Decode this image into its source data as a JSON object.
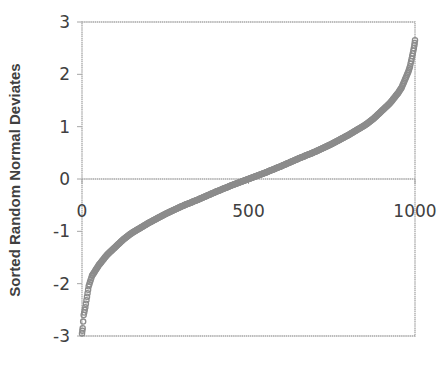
{
  "chart_data": {
    "type": "scatter",
    "title": "",
    "xlabel": "",
    "ylabel": "Sorted Random Normal Deviates",
    "xlim": [
      0,
      1000
    ],
    "ylim": [
      -3,
      3
    ],
    "x_ticks": [
      0,
      500,
      1000
    ],
    "y_ticks": [
      3,
      2,
      1,
      0,
      -1,
      -2,
      -3
    ],
    "x_tick_labels": [
      "0",
      "500",
      "1000"
    ],
    "y_tick_labels": [
      "3",
      "2",
      "1",
      "0",
      "-1",
      "-2",
      "-3"
    ],
    "grid": false,
    "legend": null,
    "marker_color": "#8c8c8c",
    "axis_color": "#a6a6a6",
    "series": [
      {
        "name": "Sorted Random Normal Deviates",
        "x": [
          0,
          2,
          5,
          10,
          15,
          20,
          30,
          40,
          50,
          75,
          100,
          125,
          150,
          200,
          250,
          300,
          350,
          400,
          450,
          500,
          550,
          600,
          650,
          700,
          750,
          800,
          850,
          875,
          900,
          925,
          950,
          960,
          970,
          980,
          985,
          990,
          995,
          998,
          1000
        ],
        "values": [
          -2.95,
          -2.85,
          -2.6,
          -2.45,
          -2.25,
          -2.05,
          -1.85,
          -1.75,
          -1.65,
          -1.45,
          -1.3,
          -1.15,
          -1.03,
          -0.84,
          -0.67,
          -0.52,
          -0.39,
          -0.25,
          -0.12,
          0.0,
          0.12,
          0.25,
          0.39,
          0.52,
          0.67,
          0.84,
          1.03,
          1.15,
          1.3,
          1.45,
          1.65,
          1.75,
          1.9,
          2.05,
          2.15,
          2.3,
          2.45,
          2.55,
          2.65
        ]
      }
    ]
  }
}
